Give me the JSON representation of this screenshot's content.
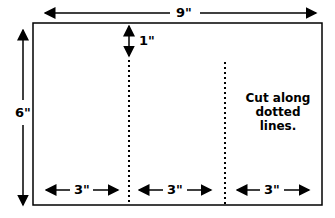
{
  "diagram": {
    "width_label": "9\"",
    "height_label": "6\"",
    "top_margin_label": "1\"",
    "section_labels": [
      "3\"",
      "3\"",
      "3\""
    ],
    "instruction_lines": [
      "Cut along",
      "dotted",
      "lines."
    ]
  }
}
